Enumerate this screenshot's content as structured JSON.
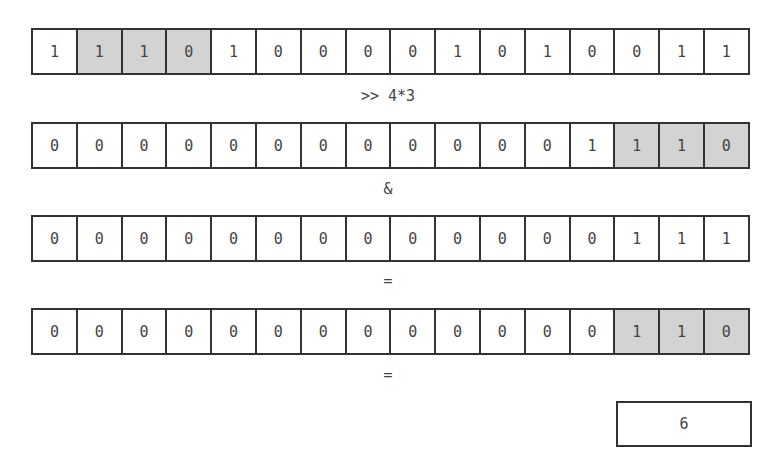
{
  "rows": [
    {
      "name": "value",
      "bits": [
        "1",
        "1",
        "1",
        "0",
        "1",
        "0",
        "0",
        "0",
        "0",
        "1",
        "0",
        "1",
        "0",
        "0",
        "1",
        "1"
      ],
      "highlight": [
        1,
        2,
        3
      ]
    },
    {
      "name": "shifted",
      "bits": [
        "0",
        "0",
        "0",
        "0",
        "0",
        "0",
        "0",
        "0",
        "0",
        "0",
        "0",
        "0",
        "1",
        "1",
        "1",
        "0"
      ],
      "highlight": [
        13,
        14,
        15
      ]
    },
    {
      "name": "mask",
      "bits": [
        "0",
        "0",
        "0",
        "0",
        "0",
        "0",
        "0",
        "0",
        "0",
        "0",
        "0",
        "0",
        "0",
        "1",
        "1",
        "1"
      ],
      "highlight": []
    },
    {
      "name": "masked",
      "bits": [
        "0",
        "0",
        "0",
        "0",
        "0",
        "0",
        "0",
        "0",
        "0",
        "0",
        "0",
        "0",
        "0",
        "1",
        "1",
        "0"
      ],
      "highlight": [
        13,
        14,
        15
      ]
    }
  ],
  "operators": {
    "shift": ">> 4*3",
    "and": "&",
    "equals1": "=",
    "equals2": "="
  },
  "result": "6",
  "colors": {
    "highlight": "#d3d3d3",
    "border": "#333333"
  }
}
